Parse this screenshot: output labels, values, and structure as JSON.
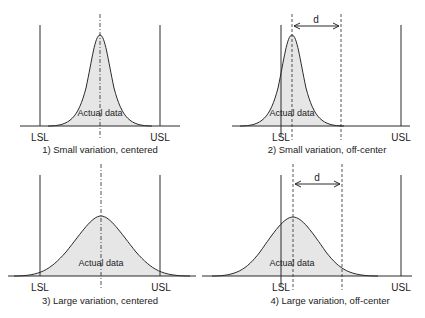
{
  "diagram": {
    "type": "process-capability-comparison",
    "colors": {
      "line": "#2a2a2a",
      "fill": "#e6e6e6",
      "background": "#ffffff"
    },
    "panels": [
      {
        "id": 1,
        "caption": "1) Small variation, centered",
        "lsl_label": "LSL",
        "usl_label": "USL",
        "curve_label": "Actual data",
        "variation": "small",
        "centered": true
      },
      {
        "id": 2,
        "caption": "2) Small variation, off-center",
        "lsl_label": "LSL",
        "usl_label": "USL",
        "curve_label": "Actual data",
        "offset_label": "d",
        "variation": "small",
        "centered": false
      },
      {
        "id": 3,
        "caption": "3) Large variation, centered",
        "lsl_label": "LSL",
        "usl_label": "USL",
        "curve_label": "Actual data",
        "variation": "large",
        "centered": true
      },
      {
        "id": 4,
        "caption": "4) Large variation, off-center",
        "lsl_label": "LSL",
        "usl_label": "USL",
        "curve_label": "Actual data",
        "offset_label": "d",
        "variation": "large",
        "centered": false
      }
    ]
  }
}
